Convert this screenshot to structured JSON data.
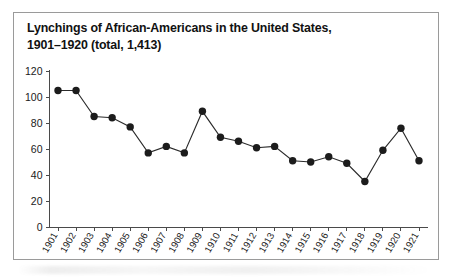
{
  "figure": {
    "title_line1": "Lynchings of African-Americans in the United States,",
    "title_line2": "1901–1920 (total, 1,413)",
    "title_full": "Lynchings of African-Americans in the United States,\n1901–1920 (total, 1,413)",
    "border_color": "#9a9a9a",
    "background_color": "#ffffff",
    "marker_color": "#1c1c1c",
    "line_color": "#2b2b2b",
    "axis_color": "#4a4a4a"
  },
  "chart_data": {
    "type": "line",
    "title": "Lynchings of African-Americans in the United States, 1901–1920 (total, 1,413)",
    "xlabel": "",
    "ylabel": "",
    "categories": [
      "1901",
      "1902",
      "1903",
      "1904",
      "1905",
      "1906",
      "1907",
      "1908",
      "1909",
      "1910",
      "1911",
      "1912",
      "1913",
      "1914",
      "1915",
      "1916",
      "1917",
      "1918",
      "1919",
      "1920",
      "1921"
    ],
    "values": [
      105,
      105,
      85,
      84,
      77,
      57,
      62,
      57,
      89,
      69,
      66,
      61,
      62,
      51,
      50,
      54,
      49,
      35,
      59,
      76,
      51
    ],
    "series": [
      {
        "name": "Lynchings",
        "values": [
          105,
          105,
          85,
          84,
          77,
          57,
          62,
          57,
          89,
          69,
          66,
          61,
          62,
          51,
          50,
          54,
          49,
          35,
          59,
          76,
          51
        ]
      }
    ],
    "ylim": [
      0,
      120
    ],
    "ytick_values": [
      0,
      20,
      40,
      60,
      80,
      100,
      120
    ],
    "ytick_labels": [
      "0",
      "20",
      "40",
      "60",
      "80",
      "100",
      "120"
    ],
    "xtick_labels": [
      "1901",
      "1902",
      "1903",
      "1904",
      "1905",
      "1906",
      "1907",
      "1908",
      "1909",
      "1910",
      "1911",
      "1912",
      "1913",
      "1914",
      "1915",
      "1916",
      "1917",
      "1918",
      "1919",
      "1920",
      "1921"
    ],
    "grid": false,
    "legend": null,
    "markers": "filled-circle",
    "xtick_label_rotation": -60
  }
}
